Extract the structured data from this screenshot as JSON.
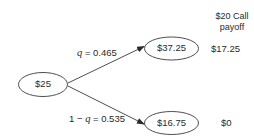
{
  "diagram": {
    "type": "binomial-tree",
    "header": {
      "line1": "$20 Call",
      "line2": "payoff"
    },
    "root": {
      "label": "$25"
    },
    "up": {
      "node_label": "$37.25",
      "prob_var": "q",
      "prob_text": " = 0.465",
      "payoff": "$17.25"
    },
    "down": {
      "node_label": "$16.75",
      "prob_prefix": "1 − ",
      "prob_var": "q",
      "prob_text": " = 0.535",
      "payoff": "$0"
    },
    "colors": {
      "stroke": "#3a3a3a",
      "text": "#2a2a2a",
      "background": "#ffffff"
    }
  }
}
